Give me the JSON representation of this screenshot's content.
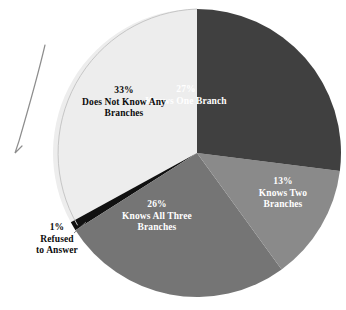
{
  "chart_data": {
    "type": "pie",
    "title": "",
    "subtitle": "",
    "xlabel": "",
    "ylabel": "",
    "legend_position": "none",
    "grid": false,
    "labels_inside_slices": true,
    "categories": [
      "Knows One Branch",
      "Knows Two Branches",
      "Knows All Three Branches",
      "Refused to Answer",
      "Does Not Know Any Branches"
    ],
    "values": [
      27,
      13,
      26,
      1,
      33
    ],
    "unit": "%",
    "slices": [
      {
        "label": "Knows One Branch",
        "percent_text": "27%",
        "value": 27,
        "color": "#404040",
        "text_color": "#ffffff",
        "label_lines": [
          "27%",
          "Knows One Branch"
        ]
      },
      {
        "label": "Knows Two Branches",
        "percent_text": "13%",
        "value": 13,
        "color": "#8a8a8a",
        "text_color": "#ffffff",
        "label_lines": [
          "13%",
          "Knows Two",
          "Branches"
        ]
      },
      {
        "label": "Knows All Three Branches",
        "percent_text": "26%",
        "value": 26,
        "color": "#757575",
        "text_color": "#ffffff",
        "label_lines": [
          "26%",
          "Knows All Three",
          "Branches"
        ]
      },
      {
        "label": "Refused to Answer",
        "percent_text": "1%",
        "value": 1,
        "color": "#111111",
        "text_color": "#0c0c0c",
        "label_lines": [
          "1%",
          "Refused",
          "to Answer"
        ],
        "label_outside": true
      },
      {
        "label": "Does Not Know Any Branches",
        "percent_text": "33%",
        "value": 33,
        "color": "#ededed",
        "text_color": "#0c0c0c",
        "label_lines": [
          "33%",
          "Does Not Know Any",
          "Branches"
        ]
      }
    ]
  },
  "labels": {
    "one_branch": {
      "pct": "27%",
      "desc": "Knows One Branch"
    },
    "two_branches": {
      "pct": "13%",
      "desc_line1": "Knows Two",
      "desc_line2": "Branches"
    },
    "all_three": {
      "pct": "26%",
      "desc_line1": "Knows All Three",
      "desc_line2": "Branches"
    },
    "none": {
      "pct": "33%",
      "desc_line1": "Does Not Know Any",
      "desc_line2": "Branches"
    },
    "refused": {
      "pct": "1%",
      "desc_line1": "Refused",
      "desc_line2": "to Answer"
    }
  },
  "colors": {
    "slice_one_branch": "#404040",
    "slice_two_branches": "#8a8a8a",
    "slice_all_three": "#757575",
    "slice_refused": "#111111",
    "slice_none": "#ededed",
    "background": "#ffffff",
    "outline": "#b8b8b8",
    "annotation_stroke": "#8d8d8d"
  }
}
